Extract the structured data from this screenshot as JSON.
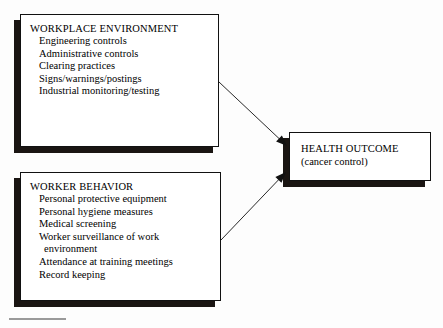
{
  "diagram": {
    "background_color": "#fdfdfd",
    "box_border_color": "#111111",
    "shadow_color": "#1a1512",
    "arrow_color": "#111111",
    "footnote_rule_color": "#9a9a9a"
  },
  "nodes": {
    "workplace": {
      "title": "WORKPLACE ENVIRONMENT",
      "items": [
        "Engineering controls",
        "Administrative controls",
        "Clearing practices",
        "Signs/warnings/postings",
        "Industrial monitoring/testing"
      ]
    },
    "worker": {
      "title": "WORKER BEHAVIOR",
      "items": [
        "Personal protective equipment",
        "Personal hygiene measures",
        "Medical screening",
        "Worker surveillance of work",
        "environment",
        "Attendance at training meetings",
        "Record keeping"
      ]
    },
    "health": {
      "title": "HEALTH OUTCOME",
      "subtitle": "(cancer control)"
    }
  },
  "arrows": [
    {
      "name": "workplace-to-health",
      "from": "workplace",
      "to": "health",
      "x1": 219,
      "y1": 82,
      "x2": 287,
      "y2": 146
    },
    {
      "name": "worker-to-health",
      "from": "worker",
      "to": "health",
      "x1": 221,
      "y1": 240,
      "x2": 286,
      "y2": 172
    }
  ]
}
